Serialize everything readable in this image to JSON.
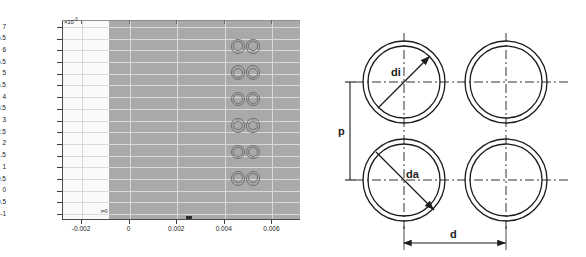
{
  "figure": {
    "panels": [
      "simulation-plot",
      "dimension-diagram"
    ]
  },
  "plot": {
    "title": "",
    "y_exponent_prefix": "×10",
    "y_exponent_power": "-3",
    "origin_annotation": "t=0",
    "x_ticks": [
      "-0.002",
      "0",
      "0.002",
      "0.004",
      "0.006"
    ],
    "y_ticks": [
      "7",
      "6.5",
      "6",
      "5.5",
      "5",
      "4.5",
      "4",
      "3.5",
      "3",
      "2.5",
      "2",
      "1.5",
      "1",
      "0.5",
      "0",
      "-0.5",
      "-1"
    ],
    "fill_color": "#a9a9a9",
    "left_region_color": "#fafafa",
    "tube_outline_color": "#6f6f6f",
    "tube_rows": 6,
    "tube_columns": 2
  },
  "chart_data": {
    "type": "scatter",
    "title": "",
    "xlabel": "",
    "ylabel": "",
    "xlim": [
      -0.0028,
      0.0072
    ],
    "ylim": [
      -0.00125,
      0.0073
    ],
    "x_tick_values": [
      -0.002,
      0,
      0.002,
      0.004,
      0.006
    ],
    "x_tick_labels": [
      "-0.002",
      "0",
      "0.002",
      "0.004",
      "0.006"
    ],
    "y_tick_values": [
      -0.001,
      -0.0005,
      0,
      0.0005,
      0.001,
      0.0015,
      0.002,
      0.0025,
      0.003,
      0.0035,
      0.004,
      0.0045,
      0.005,
      0.0055,
      0.006,
      0.0065,
      0.007
    ],
    "y_tick_labels": [
      "-1",
      "-0.5",
      "0",
      "0.5",
      "1",
      "1.5",
      "2",
      "2.5",
      "3",
      "3.5",
      "4",
      "4.5",
      "5",
      "5.5",
      "6",
      "6.5",
      "7"
    ],
    "y_axis_multiplier": "x10^-3",
    "grid": true,
    "legend": "none",
    "annotations": [
      "t=0"
    ],
    "series": [
      {
        "name": "tube-array",
        "marker": "annular-circle",
        "columns_x": [
          0.00455,
          0.00518
        ],
        "rows_y": [
          0.00618,
          0.00505,
          0.00392,
          0.00279,
          0.00166,
          0.00053
        ],
        "outer_diameter": 0.00062,
        "inner_diameter": 0.00055,
        "count": 12
      }
    ]
  },
  "diagram": {
    "name": "tube-bundle-pitch-diagram",
    "labels": {
      "inner_diameter": "di",
      "outer_diameter": "da",
      "vertical_pitch": "p",
      "horizontal_pitch": "d"
    },
    "tube_count": 4,
    "line_color": "#1c1c1c",
    "centerline_style": "dash-dot"
  }
}
